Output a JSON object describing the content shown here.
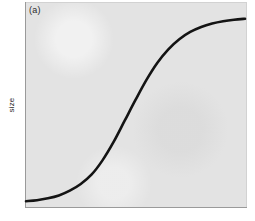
{
  "figure": {
    "panel_label": "(a)",
    "ylabel": "size",
    "xlabel": "",
    "title": ""
  },
  "colors": {
    "panel_background": "#e3e3e3",
    "outer_background": "#ffffff",
    "curve": "#141414",
    "axis_spine": "#9a9a9a",
    "text": "#2b2b2b"
  },
  "chart_data": {
    "type": "line",
    "title": "",
    "subtitle": "",
    "panel_label": "(a)",
    "xlabel": "",
    "ylabel": "size",
    "legend": [],
    "legend_position": "none",
    "grid": false,
    "xticks": [],
    "yticks": [],
    "xtick_labels": [],
    "ytick_labels": [],
    "xlim": [
      0,
      1
    ],
    "ylim": [
      0,
      1
    ],
    "annotations": [
      {
        "text": "(a)",
        "x": 0.02,
        "y": 0.96
      }
    ],
    "series": [
      {
        "name": "sigmoid growth",
        "shape": "logistic",
        "color": "#141414",
        "linewidth": 2.6,
        "x": [
          0.0,
          0.05,
          0.1,
          0.15,
          0.2,
          0.25,
          0.3,
          0.35,
          0.4,
          0.45,
          0.5,
          0.55,
          0.6,
          0.65,
          0.7,
          0.75,
          0.8,
          0.85,
          0.9,
          0.95,
          1.0
        ],
        "values": [
          0.02,
          0.025,
          0.035,
          0.05,
          0.075,
          0.11,
          0.16,
          0.235,
          0.33,
          0.44,
          0.55,
          0.655,
          0.745,
          0.815,
          0.868,
          0.906,
          0.932,
          0.95,
          0.962,
          0.97,
          0.975
        ]
      }
    ]
  }
}
